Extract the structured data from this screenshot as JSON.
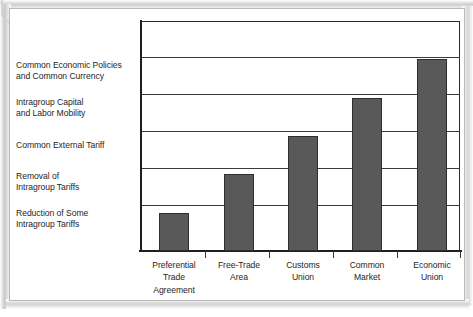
{
  "figure": {
    "title_remnant": "",
    "background_color": "#ffffff",
    "frame_color": "#b9b9b9"
  },
  "chart_data": {
    "type": "bar",
    "title": "",
    "subtitle": "",
    "xlabel": "",
    "ylabel": "",
    "categories": [
      "Preferential\nTrade\nAgreement",
      "Free-Trade\nArea",
      "Customs\nUnion",
      "Common\nMarket",
      "Economic\nUnion"
    ],
    "category_lines": [
      [
        "Preferential",
        "Trade",
        "Agreement"
      ],
      [
        "Free-Trade",
        "Area"
      ],
      [
        "Customs",
        "Union"
      ],
      [
        "Common",
        "Market"
      ],
      [
        "Economic",
        "Union"
      ]
    ],
    "values": [
      1,
      2,
      3,
      4,
      5
    ],
    "ylim": [
      0,
      6
    ],
    "ytick_count": 6,
    "grid": true,
    "legend": false,
    "bar_color": "#595959",
    "bar_edge_color": "#2e2e2e",
    "axis_color": "#1f1f1f",
    "y_band_labels": [
      "",
      "Common Economic Policies and Common Currency",
      "Intragroup Capital and Labor Mobility",
      "Common External Tariff",
      "Removal of Intragroup Tariffs",
      "Reduction of Some Intragroup Tariffs"
    ]
  },
  "stage_labels": [
    {
      "line1": "Common Economic Policies",
      "line2": "and Common Currency"
    },
    {
      "line1": "Intragroup Capital",
      "line2": "and Labor Mobility"
    },
    {
      "line1": "Common External Tariff",
      "line2": ""
    },
    {
      "line1": "Removal of",
      "line2": "Intragroup Tariffs"
    },
    {
      "line1": "Reduction of Some",
      "line2": "Intragroup Tariffs"
    }
  ],
  "categories": [
    {
      "line1": "Preferential",
      "line2": "Trade",
      "line3": "Agreement"
    },
    {
      "line1": "Free-Trade",
      "line2": "Area",
      "line3": ""
    },
    {
      "line1": "Customs",
      "line2": "Union",
      "line3": ""
    },
    {
      "line1": "Common",
      "line2": "Market",
      "line3": ""
    },
    {
      "line1": "Economic",
      "line2": "Union",
      "line3": ""
    }
  ]
}
